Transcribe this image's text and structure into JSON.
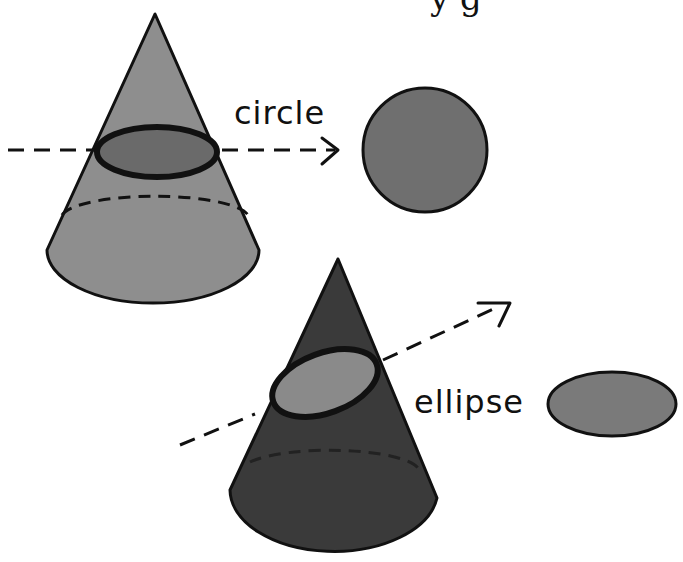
{
  "diagram": {
    "title_fragment": "y      g",
    "labels": {
      "circle": "circle",
      "ellipse": "ellipse"
    },
    "colors": {
      "cone_light": "#8e8e8e",
      "cone_dark": "#3a3a3a",
      "section_circle": "#6a6a6a",
      "section_ellipse": "#8a8a8a",
      "result_circle": "#6f6f6f",
      "result_ellipse": "#7a7a7a",
      "outline": "#111111",
      "background": "#ffffff"
    },
    "figures": [
      {
        "name": "horizontal-cut-cone",
        "section": "circle"
      },
      {
        "name": "slanted-cut-cone",
        "section": "ellipse"
      }
    ]
  }
}
